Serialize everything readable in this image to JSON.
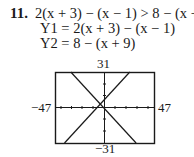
{
  "problem": {
    "number": "11.",
    "inequality": "2(x + 3) − (x − 1) > 8 − (x + 9)",
    "y1": "Y1 = 2(x + 3) − (x − 1)",
    "y2": "Y2 = 8 − (x + 9)"
  },
  "graph": {
    "window": {
      "xmin": "−47",
      "xmax": "47",
      "ymin": "−31",
      "ymax": "31"
    },
    "curves": [
      {
        "name": "Y1",
        "expr": "x + 7"
      },
      {
        "name": "Y2",
        "expr": "−x − 1"
      }
    ],
    "intersection": {
      "x": -4,
      "y": 3
    }
  }
}
